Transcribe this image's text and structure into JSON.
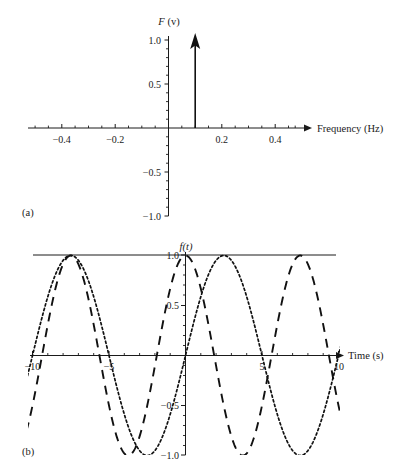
{
  "figure": {
    "panels": [
      {
        "tag": "(a)",
        "tag_x": 22,
        "tag_y": 215,
        "type": "impulse-spectrum"
      },
      {
        "tag": "(b)",
        "tag_x": 22,
        "tag_y": 452,
        "type": "time-waveforms"
      }
    ]
  },
  "panel_a": {
    "tag": "(a)",
    "y_axis_title": "F (v)",
    "y_axis_title_italic": "F",
    "y_axis_title_rest": " (v)",
    "x_axis_title": "Frequency (Hz)",
    "x_tick_labels": [
      "−0.4",
      "−0.2",
      "0.2",
      "0.4"
    ],
    "x_tick_values": [
      -0.4,
      -0.2,
      0.2,
      0.4
    ],
    "y_tick_labels": [
      "1.0",
      "0.5",
      "−0.5",
      "−1.0"
    ],
    "y_tick_values": [
      1.0,
      0.5,
      -0.5,
      -1.0
    ],
    "x_min": -0.5,
    "x_max": 0.5,
    "y_min": -1.0,
    "y_max": 1.0,
    "impulse": {
      "frequency": 0.1,
      "amplitude": 1.0,
      "label": "delta impulse at 0.1 Hz amplitude 1.0"
    }
  },
  "panel_b": {
    "tag": "(b)",
    "y_axis_title": "f(t)",
    "y_axis_title_italic": "f",
    "y_axis_title_rest": "(t)",
    "x_axis_title": "Time (s)",
    "x_tick_labels": [
      "−10",
      "−5",
      "5",
      "10"
    ],
    "x_tick_values": [
      -10,
      -5,
      5,
      10
    ],
    "y_tick_labels": [
      "1.0",
      "0.5",
      "−0.5",
      "−1.0"
    ],
    "y_tick_values": [
      1.0,
      0.5,
      -0.5,
      -1.0
    ],
    "x_min": -10.6,
    "x_max": 10.6,
    "y_min": -1.0,
    "y_max": 1.0
  },
  "chart_data": [
    {
      "type": "bar",
      "id": "panel-a",
      "title": "(a)",
      "xlabel": "Frequency (Hz)",
      "ylabel": "F (v)",
      "xlim": [
        -0.5,
        0.5
      ],
      "ylim": [
        -1.0,
        1.0
      ],
      "xticks": [
        -0.4,
        -0.2,
        0.2,
        0.4
      ],
      "xticklabels": [
        "−0.4",
        "−0.2",
        "0.2",
        "0.4"
      ],
      "yticks": [
        1.0,
        0.5,
        -0.5,
        -1.0
      ],
      "yticklabels": [
        "1.0",
        "0.5",
        "−0.5",
        "−1.0"
      ],
      "grid": false,
      "legend": "none",
      "categories": [
        0.1
      ],
      "values": [
        1.0
      ],
      "annotations": [
        "single arrow-tipped impulse at f = 0.1 Hz reaching 1.0"
      ]
    },
    {
      "type": "line",
      "id": "panel-b",
      "title": "(b)",
      "xlabel": "Time (s)",
      "ylabel": "f(t)",
      "xlim": [
        -10.6,
        10.6
      ],
      "ylim": [
        -1.0,
        1.0
      ],
      "xticks": [
        -10,
        -5,
        5,
        10
      ],
      "xticklabels": [
        "−10",
        "−5",
        "5",
        "10"
      ],
      "yticks": [
        1.0,
        0.5,
        -0.5,
        -1.0
      ],
      "yticklabels": [
        "1.0",
        "0.5",
        "−0.5",
        "−1.0"
      ],
      "grid": false,
      "legend": "none",
      "series": [
        {
          "name": "sine (fine dotted)",
          "style": "dotted",
          "formula": "sin(2*pi*t/10)",
          "amplitude": 1.0,
          "period": 10,
          "phase": 0,
          "x": [
            -10,
            -9,
            -8,
            -7.5,
            -7,
            -6,
            -5,
            -4,
            -3,
            -2.5,
            -2,
            -1,
            0,
            1,
            2,
            2.5,
            3,
            4,
            5,
            6,
            7,
            7.5,
            8,
            9,
            10
          ],
          "values": [
            0,
            0.588,
            0.951,
            1.0,
            0.951,
            0.588,
            0,
            -0.588,
            -0.951,
            -1.0,
            -0.951,
            -0.588,
            0,
            0.588,
            0.951,
            1.0,
            0.951,
            0.588,
            0,
            -0.588,
            -0.951,
            -1.0,
            -0.951,
            -0.588,
            0
          ]
        },
        {
          "name": "cosine (long dashed)",
          "style": "dashed",
          "formula": "cos(2*pi*t/7.5)",
          "amplitude": 1.0,
          "period": 7.5,
          "phase": 0,
          "x": [
            -10,
            -9,
            -8,
            -7.5,
            -6,
            -5.3,
            -4.5,
            -3.75,
            -2.5,
            -1.5,
            0,
            1.5,
            2.5,
            3.75,
            4.5,
            5.3,
            6,
            7.5,
            8,
            9,
            10
          ],
          "values": [
            0.866,
            0.482,
            0.0,
            -0.309,
            -0.866,
            -1.0,
            -0.866,
            0.0,
            0.766,
            0.966,
            1.0,
            0.966,
            0.766,
            0.0,
            -0.866,
            -1.0,
            -0.866,
            -0.309,
            0.0,
            0.482,
            0.866
          ]
        }
      ]
    }
  ]
}
